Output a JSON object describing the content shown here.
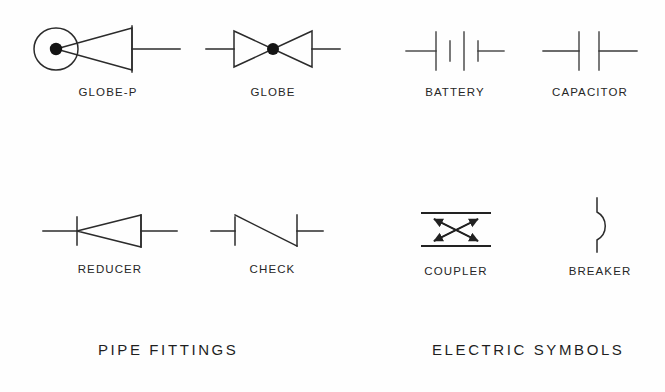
{
  "sheet": {
    "background_color": "#fefefe",
    "line_color": "#2b2b2b"
  },
  "sections": [
    {
      "id": "pipe-fittings",
      "title": "PIPE  FITTINGS"
    },
    {
      "id": "electric-symbols",
      "title": "ELECTRIC  SYMBOLS"
    }
  ],
  "symbols": [
    {
      "id": "globe-p",
      "label": "GLOBE-P",
      "icon": "globe-valve-with-plug-symbol",
      "group": "pipe-fittings",
      "row": 1
    },
    {
      "id": "globe",
      "label": "GLOBE",
      "icon": "globe-valve-bowtie-symbol",
      "group": "pipe-fittings",
      "row": 1
    },
    {
      "id": "battery",
      "label": "BATTERY",
      "icon": "battery-cell-symbol",
      "group": "electric-symbols",
      "row": 1
    },
    {
      "id": "capacitor",
      "label": "CAPACITOR",
      "icon": "capacitor-plates-symbol",
      "group": "electric-symbols",
      "row": 1
    },
    {
      "id": "reducer",
      "label": "REDUCER",
      "icon": "pipe-reducer-symbol",
      "group": "pipe-fittings",
      "row": 2
    },
    {
      "id": "check",
      "label": "CHECK",
      "icon": "check-valve-symbol",
      "group": "pipe-fittings",
      "row": 2
    },
    {
      "id": "coupler",
      "label": "COUPLER",
      "icon": "coupler-crossed-arrows-symbol",
      "group": "electric-symbols",
      "row": 2
    },
    {
      "id": "breaker",
      "label": "BREAKER",
      "icon": "circuit-breaker-symbol",
      "group": "electric-symbols",
      "row": 2
    }
  ]
}
